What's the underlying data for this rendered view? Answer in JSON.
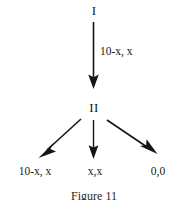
{
  "figure": {
    "caption": "Figure 11",
    "line_color": "#151515",
    "text_color": "#1a1a1a",
    "background": "#ffffff",
    "nodes": [
      {
        "id": "root",
        "label": "I",
        "x": 93,
        "y": 10
      },
      {
        "id": "second",
        "label": "II",
        "x": 93,
        "y": 107
      }
    ],
    "edges": [
      {
        "id": "edge-i-ii",
        "label": "10-x, x",
        "from": "I",
        "to": "II",
        "direction": "down",
        "label_x": 98,
        "label_y": 48
      },
      {
        "id": "edge-ii-left",
        "label": "",
        "from": "II",
        "to": "10-x, x",
        "direction": "down-left"
      },
      {
        "id": "edge-ii-middle",
        "label": "",
        "from": "II",
        "to": "x,x",
        "direction": "down"
      },
      {
        "id": "edge-ii-right",
        "label": "",
        "from": "II",
        "to": "0,0",
        "direction": "down-right"
      }
    ],
    "payoffs": [
      {
        "id": "payoff-left",
        "label": "10-x, x",
        "x": 33,
        "y": 172
      },
      {
        "id": "payoff-middle",
        "label": "x,x",
        "x": 95,
        "y": 172
      },
      {
        "id": "payoff-right",
        "label": "0,0",
        "x": 163,
        "y": 172
      }
    ]
  }
}
